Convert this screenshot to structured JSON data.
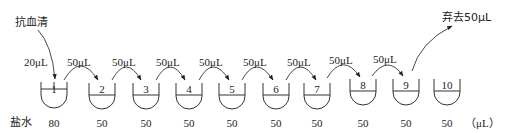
{
  "diagram": {
    "type": "serial-dilution",
    "source_label": "抗血清",
    "initial_transfer": "20μL",
    "discard_label": "弃去50μL",
    "row_label": "盐水",
    "unit_label": "（μL）",
    "transfers": [
      "50μL",
      "50μL",
      "50μL",
      "50μL",
      "50μL",
      "50μL",
      "50μL",
      "50μL"
    ],
    "tubes": [
      {
        "number": "1",
        "saline": "80"
      },
      {
        "number": "2",
        "saline": "50"
      },
      {
        "number": "3",
        "saline": "50"
      },
      {
        "number": "4",
        "saline": "50"
      },
      {
        "number": "5",
        "saline": "50"
      },
      {
        "number": "6",
        "saline": "50"
      },
      {
        "number": "7",
        "saline": "50"
      },
      {
        "number": "8",
        "saline": "50"
      },
      {
        "number": "9",
        "saline": "50"
      },
      {
        "number": "10",
        "saline": "50"
      }
    ]
  },
  "colors": {
    "ink": "#222222",
    "background": "#ffffff"
  }
}
